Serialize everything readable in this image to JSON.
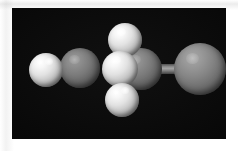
{
  "image": {
    "kind": "molecular-model-render",
    "width": 238,
    "height": 151,
    "background_color": "#ffffff",
    "canvas_color": "#060606",
    "canvas": {
      "x": 12,
      "y": 8,
      "width": 214,
      "height": 131
    },
    "caption": ""
  },
  "palette": {
    "background": "#ffffff",
    "canvas": "#060606",
    "hydrogen": "#f2f2f2",
    "hydrogen_shadow": "#565656",
    "carbon": "#7b7b7b",
    "carbon_shadow": "#303030",
    "carbon_terminal": "#858585",
    "bond": "#9a9a9a",
    "highlight": "#ffffff"
  },
  "molecule": {
    "atoms": [
      {
        "id": "h-left",
        "element": "H",
        "label": "hydrogen",
        "color": "#f2f2f2",
        "x": 46,
        "y": 70,
        "radius": 17
      },
      {
        "id": "c-left",
        "element": "C",
        "label": "carbon",
        "color": "#7b7b7b",
        "x": 80,
        "y": 68,
        "radius": 20
      },
      {
        "id": "h-top",
        "element": "H",
        "label": "hydrogen",
        "color": "#f2f2f2",
        "x": 125,
        "y": 40,
        "radius": 17
      },
      {
        "id": "h-front",
        "element": "H",
        "label": "hydrogen",
        "color": "#f2f2f2",
        "x": 120,
        "y": 69,
        "radius": 18
      },
      {
        "id": "h-bottom",
        "element": "H",
        "label": "hydrogen",
        "color": "#f2f2f2",
        "x": 122,
        "y": 100,
        "radius": 17
      },
      {
        "id": "c-center",
        "element": "C",
        "label": "carbon",
        "color": "#7b7b7b",
        "x": 141,
        "y": 70,
        "radius": 21
      },
      {
        "id": "c-right",
        "element": "C",
        "label": "carbon",
        "color": "#858585",
        "x": 200,
        "y": 69,
        "radius": 26
      }
    ],
    "bonds": [
      {
        "id": "bond-h-left-c-left",
        "from": "h-left",
        "to": "c-left",
        "order": 1
      },
      {
        "id": "bond-c-center-c-right",
        "from": "c-center",
        "to": "c-right",
        "order": 1
      },
      {
        "id": "bond-h-top-c-center",
        "from": "h-top",
        "to": "c-center",
        "order": 1
      },
      {
        "id": "bond-h-bottom-c-center",
        "from": "h-bottom",
        "to": "c-center",
        "order": 1
      }
    ],
    "atom_count": 7,
    "bond_count": 4
  }
}
